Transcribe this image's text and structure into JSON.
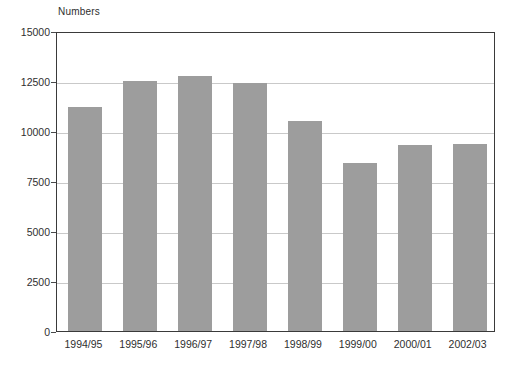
{
  "chart_data": {
    "type": "bar",
    "title": "",
    "axis_note": "Numbers",
    "xlabel": "",
    "ylabel": "Numbers",
    "categories": [
      "1994/95",
      "1995/96",
      "1996/97",
      "1997/98",
      "1998/99",
      "1999/00",
      "2000/01",
      "2002/03"
    ],
    "values": [
      11200,
      12500,
      12750,
      12400,
      10500,
      8400,
      9300,
      9350
    ],
    "ylim": [
      0,
      15000
    ],
    "yticks": [
      0,
      2500,
      5000,
      7500,
      10000,
      12500,
      15000
    ],
    "ytick_labels": [
      "0",
      "2500",
      "5000",
      "7500",
      "10000",
      "12500",
      "15000"
    ],
    "grid": true,
    "legend": "none",
    "bar_color": "#9d9d9d",
    "gridline_color": "#c9c9c9",
    "axis_color": "#3a3a3a",
    "background": "#ffffff"
  }
}
